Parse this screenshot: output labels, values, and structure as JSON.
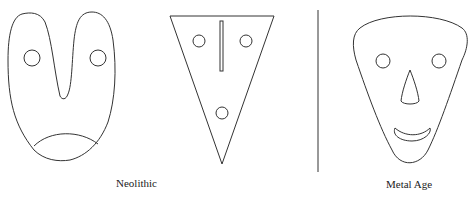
{
  "figure": {
    "groups": [
      {
        "label": "Neolithic",
        "items": [
          {
            "name": "u-shaped-mask",
            "features": [
              "two round eyes",
              "deep central notch",
              "curved chin line"
            ]
          },
          {
            "name": "triangular-mask",
            "features": [
              "two round eyes",
              "vertical nose bar",
              "round mouth"
            ]
          }
        ]
      },
      {
        "label": "Metal Age",
        "items": [
          {
            "name": "rounded-triangle-face",
            "features": [
              "two round eyes",
              "triangular nose",
              "crescent smile"
            ]
          }
        ]
      }
    ],
    "divider": "vertical line separating periods",
    "colors": {
      "stroke": "#333333",
      "background": "#ffffff"
    }
  }
}
